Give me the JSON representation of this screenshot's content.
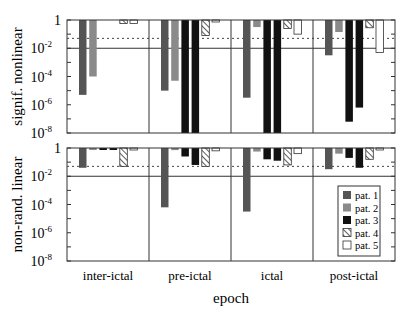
{
  "chart_data": {
    "type": "bar",
    "yscale": "log",
    "xlabel": "epoch",
    "categories": [
      "inter-ictal",
      "pre-ictal",
      "ictal",
      "post-ictal"
    ],
    "ylim": [
      1e-08,
      1
    ],
    "yticks": [
      "1",
      "10^-2",
      "10^-4",
      "10^-6",
      "10^-8"
    ],
    "reference_lines": [
      {
        "value": 0.01,
        "style": "solid"
      },
      {
        "value": 0.05,
        "style": "dotted"
      }
    ],
    "legend": {
      "position": "lower right of bottom panel",
      "entries": [
        {
          "label": "pat. 1",
          "fill": "#555555",
          "pattern": "solid"
        },
        {
          "label": "pat. 2",
          "fill": "#8a8a8a",
          "pattern": "solid"
        },
        {
          "label": "pat. 3",
          "fill": "#111111",
          "pattern": "solid"
        },
        {
          "label": "pat. 4",
          "fill": "#ffffff",
          "pattern": "hatched"
        },
        {
          "label": "pat. 5",
          "fill": "#ffffff",
          "pattern": "empty"
        }
      ]
    },
    "panels": [
      {
        "ylabel": "signif. nonlinear",
        "series_log10": {
          "pat. 1": [
            -5.3,
            -5.0,
            -5.5,
            -2.5
          ],
          "pat. 2": [
            -4.0,
            -4.3,
            -0.5,
            -0.85
          ],
          "pat. 3a": [
            0,
            -8.0,
            -8.0,
            -7.2
          ],
          "pat. 3b": [
            0,
            -8.0,
            -8.0,
            -6.2
          ],
          "pat. 4": [
            -0.25,
            -1.1,
            -0.6,
            -0.55
          ],
          "pat. 5": [
            -0.25,
            -0.05,
            -1.0,
            -2.3
          ]
        }
      },
      {
        "ylabel": "non-rand. linear",
        "series_log10": {
          "pat. 1": [
            -1.4,
            -4.2,
            -4.5,
            -1.5
          ],
          "pat. 2": [
            -0.05,
            -0.15,
            -0.25,
            -0.4
          ],
          "pat. 3a": [
            -0.1,
            -0.6,
            -0.8,
            -0.7
          ],
          "pat. 3b": [
            -0.1,
            -1.2,
            -0.9,
            -1.4
          ],
          "pat. 4": [
            -1.3,
            -1.3,
            -1.2,
            -0.8
          ],
          "pat. 5": [
            -0.1,
            -0.2,
            -0.4,
            -0.1
          ]
        }
      }
    ]
  },
  "panels": [
    {
      "ylabel": "signif. nonlinear"
    },
    {
      "ylabel": "non-rand. linear"
    }
  ],
  "xaxis": {
    "title": "epoch",
    "labels": [
      "inter-ictal",
      "pre-ictal",
      "ictal",
      "post-ictal"
    ]
  },
  "legend": [
    "pat. 1",
    "pat. 2",
    "pat. 3",
    "pat. 4",
    "pat. 5"
  ]
}
